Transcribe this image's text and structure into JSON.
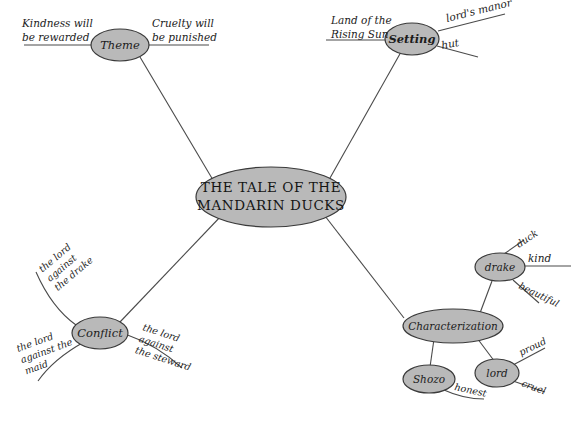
{
  "diagram": {
    "type": "mind-map",
    "title": "THE TALE OF THE MANDARIN DUCKS",
    "central_node": {
      "line1": "THE TALE OF THE",
      "line2": "MANDARIN DUCKS"
    },
    "colors": {
      "node_fill": "#b9b9b9",
      "node_stroke": "#3a3a3a",
      "edge": "#4a4a4a",
      "text": "#1c1c1c",
      "background": "#ffffff"
    },
    "branches": [
      {
        "id": "theme",
        "label": "Theme",
        "leaves": [
          {
            "id": "theme-kindness",
            "line1": "Kindness will",
            "line2": "be rewarded"
          },
          {
            "id": "theme-cruelty",
            "line1": "Cruelty will",
            "line2": "be punished"
          }
        ]
      },
      {
        "id": "setting",
        "label": "Setting",
        "leaves": [
          {
            "id": "setting-land",
            "line1": "Land of the",
            "line2": "Rising Sun"
          },
          {
            "id": "setting-manor",
            "line1": "lord's manor",
            "line2": ""
          },
          {
            "id": "setting-hut",
            "line1": "hut",
            "line2": ""
          }
        ]
      },
      {
        "id": "conflict",
        "label": "Conflict",
        "leaves": [
          {
            "id": "conflict-drake",
            "line1": "the lord",
            "line2": "against",
            "line3": "the drake"
          },
          {
            "id": "conflict-maid",
            "line1": "the lord",
            "line2": "against the",
            "line3": "maid"
          },
          {
            "id": "conflict-steward",
            "line1": "the lord",
            "line2": "against",
            "line3": "the steward"
          }
        ]
      },
      {
        "id": "characterization",
        "label": "Characterization",
        "children": [
          {
            "id": "drake",
            "label": "drake",
            "leaves": [
              {
                "id": "drake-duck",
                "line1": "duck"
              },
              {
                "id": "drake-kind",
                "line1": "kind"
              },
              {
                "id": "drake-beautiful",
                "line1": "beautiful"
              }
            ]
          },
          {
            "id": "shozo",
            "label": "Shozo",
            "leaves": [
              {
                "id": "shozo-honest",
                "line1": "honest"
              }
            ]
          },
          {
            "id": "lord",
            "label": "lord",
            "leaves": [
              {
                "id": "lord-proud",
                "line1": "proud"
              },
              {
                "id": "lord-cruel",
                "line1": "cruel"
              }
            ]
          }
        ]
      }
    ]
  }
}
